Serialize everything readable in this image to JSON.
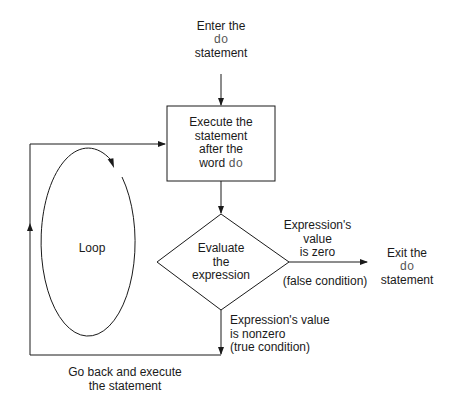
{
  "diagram": {
    "type": "flowchart",
    "start": {
      "line1": "Enter the",
      "keyword": "do",
      "line3": "statement"
    },
    "process": {
      "line1": "Execute the",
      "line2": "statement",
      "line3": "after the",
      "line4_prefix": "word ",
      "keyword": "do"
    },
    "decision": {
      "line1": "Evaluate",
      "line2": "the",
      "line3": "expression"
    },
    "false_branch": {
      "line1": "Expression's",
      "line2": "value",
      "line3": "is zero",
      "condition": "(false condition)"
    },
    "exit": {
      "line1": "Exit the",
      "keyword": "do",
      "line3": "statement"
    },
    "true_branch": {
      "line1": "Expression's value",
      "line2": "is nonzero",
      "line3": "(true condition)"
    },
    "back_edge": {
      "line1": "Go back and execute",
      "line2": "the statement"
    },
    "loop_label": "Loop"
  }
}
